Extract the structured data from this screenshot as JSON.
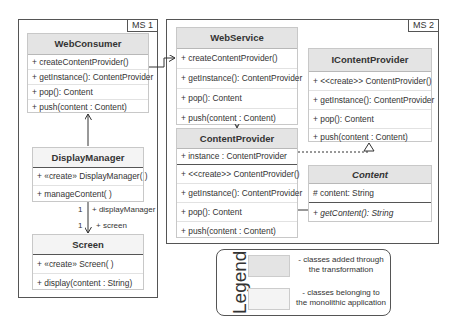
{
  "frames": [
    {
      "tag": "MS 1"
    },
    {
      "tag": "MS 2"
    }
  ],
  "classes": {
    "web_consumer": {
      "name": "WebConsumer",
      "methods": [
        "+  createContentProvider()",
        "+ getInstance(): ContentProvider",
        "+ pop(): Content",
        "+ push(content : Content)"
      ]
    },
    "display_manager": {
      "name": "DisplayManager",
      "methods": [
        "+ «create» DisplayManager( )",
        "+ manageContent( )"
      ]
    },
    "screen": {
      "name": "Screen",
      "methods": [
        "+ «create» Screen( )",
        "+ display(content : String)"
      ]
    },
    "web_service": {
      "name": "WebService",
      "methods": [
        "+  createContentProvider()",
        "+ getInstance(): ContentProvider",
        "+ pop(): Content",
        "+ push(content : Content)"
      ]
    },
    "content_provider": {
      "name": "ContentProvider",
      "attributes": [
        "+ instance : ContentProvider"
      ],
      "methods": [
        "+ <<create>> ContentProvider()",
        "+ getInstance(): ContentProvider",
        "+ pop(): Content",
        "+ push(content : Content)"
      ]
    },
    "icontent_provider": {
      "name": "IContentProvider",
      "methods": [
        "+ <<create>> ContentProvider()",
        "+ getInstance(): ContentProvider",
        "+ pop(): Content",
        "+ push(content : Content)"
      ]
    },
    "content": {
      "name": "Content",
      "attributes": [
        "# content: String"
      ],
      "methods": [
        "+ getContent(): String"
      ]
    }
  },
  "associations": {
    "dm_screen": {
      "mult_top": "1",
      "role_top": "+ displayManager",
      "mult_bottom": "1",
      "role_bottom": "+ screen"
    }
  },
  "legend": {
    "title": "Legend",
    "items": [
      {
        "text": "- classes added through the transformation",
        "color": "#e4e4e4"
      },
      {
        "text": "- classes belonging to the monolithic application",
        "color": "#f4f4f4"
      }
    ]
  }
}
